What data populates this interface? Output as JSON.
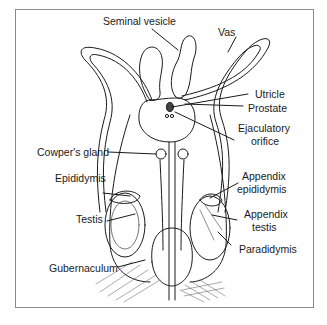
{
  "figure": {
    "type": "anatomical line drawing",
    "labels": {
      "seminal_vesicle": "Seminal vesicle",
      "vas": "Vas",
      "utricle": "Utricle",
      "prostate": "Prostate",
      "ejaculatory_orifice_1": "Ejaculatory",
      "ejaculatory_orifice_2": "orifice",
      "cowpers_gland": "Cowper's gland",
      "epididymis": "Epididymis",
      "appendix_epididymis_1": "Appendix",
      "appendix_epididymis_2": "epididymis",
      "testis": "Testis",
      "appendix_testis_1": "Appendix",
      "appendix_testis_2": "testis",
      "paradidymis": "Paradidymis",
      "gubernaculum": "Gubernaculum"
    },
    "colors": {
      "ink": "#1a1a1a",
      "frame": "#8a8a8a",
      "background": "#ffffff"
    }
  }
}
